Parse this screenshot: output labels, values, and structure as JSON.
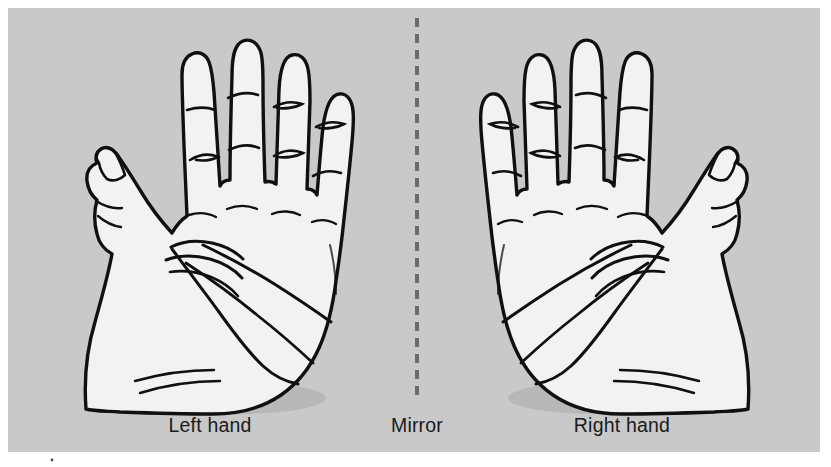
{
  "figure": {
    "panel": {
      "background_color": "#c9c9c9",
      "page_background_color": "#ffffff",
      "x": 8,
      "y": 8,
      "width": 812,
      "height": 444
    },
    "hand_style": {
      "fill_color": "#f2f2f2",
      "outline_color": "#101010",
      "crease_color": "#101010",
      "shadow_color": "#b5b5b5"
    },
    "mirror_line": {
      "color": "#6b6b6b",
      "x": 417,
      "y_start": 18,
      "y_end": 400,
      "dash_on": 9,
      "dash_off": 7,
      "width": 4
    },
    "labels": [
      {
        "name": "left-hand-label",
        "text": "Left hand",
        "x": 210,
        "y": 432
      },
      {
        "name": "mirror-label",
        "text": "Mirror",
        "x": 417,
        "y": 432
      },
      {
        "name": "right-hand-label",
        "text": "Right hand",
        "x": 622,
        "y": 432
      }
    ],
    "objects": [
      {
        "name": "left-hand",
        "chirality": "left",
        "description": "Open left palm facing viewer, thumb on the left side"
      },
      {
        "name": "right-hand",
        "chirality": "right",
        "description": "Open right palm facing viewer, thumb on the right side, mirror image of the left hand"
      }
    ],
    "speck": {
      "x": 52,
      "y": 460,
      "color": "#4a4a4a"
    }
  }
}
